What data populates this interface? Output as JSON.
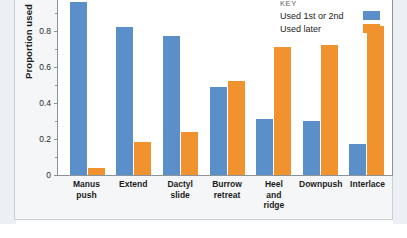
{
  "chart_data": {
    "type": "bar",
    "title": "",
    "xlabel": "",
    "ylabel": "Proportion used",
    "ylim": [
      0,
      1
    ],
    "yticks": [
      "0",
      "0.2",
      "0.4",
      "0.6",
      "0.8",
      "1"
    ],
    "grid": false,
    "legend_position": "top-right",
    "legend_title": "KEY",
    "categories": [
      "Manus push",
      "Extend",
      "Dactyl slide",
      "Burrow retreat",
      "Heel and ridge",
      "Downpush",
      "Interlace"
    ],
    "category_lines": [
      [
        "Manus",
        "push"
      ],
      [
        "Extend"
      ],
      [
        "Dactyl",
        "slide"
      ],
      [
        "Burrow",
        "retreat"
      ],
      [
        "Heel",
        "and",
        "ridge"
      ],
      [
        "Downpush"
      ],
      [
        "Interlace"
      ]
    ],
    "series": [
      {
        "name": "Used 1st or 2nd",
        "color": "#5b8fc9",
        "values": [
          0.96,
          0.82,
          0.77,
          0.49,
          0.31,
          0.3,
          0.17
        ]
      },
      {
        "name": "Used later",
        "color": "#f0922e",
        "values": [
          0.04,
          0.185,
          0.24,
          0.52,
          0.71,
          0.72,
          0.83
        ]
      }
    ]
  },
  "colors": {
    "series_blue": "#5b8fc9",
    "series_orange": "#f0922e",
    "axis": "#8b9298",
    "panel_background": "#f4f6f8",
    "plot_background": "#ffffff"
  }
}
